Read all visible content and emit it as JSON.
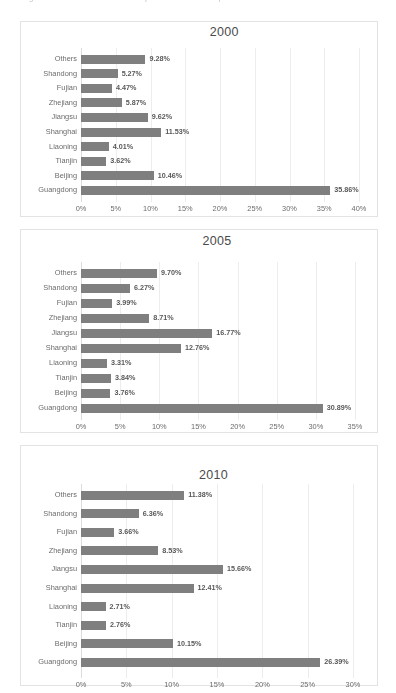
{
  "header": {
    "cut_off_text": "Figure 3. Shares of Provincial Exports in National Exports"
  },
  "panels": [
    {
      "name": "chart-2000",
      "title": "2000",
      "title_left_pct": 53,
      "chart_data": {
        "type": "bar",
        "orientation": "horizontal",
        "title": "2000",
        "xlabel": "",
        "ylabel": "",
        "xlim": [
          0,
          40
        ],
        "grid": true,
        "legend": "none",
        "categories": [
          "Others",
          "Shandong",
          "Fujian",
          "Zhejiang",
          "Jiangsu",
          "Shanghai",
          "Liaoning",
          "Tianjin",
          "Beijing",
          "Guangdong"
        ],
        "values": [
          9.28,
          5.27,
          4.47,
          5.87,
          9.62,
          11.53,
          4.01,
          3.62,
          10.46,
          35.86
        ],
        "labels": [
          "9.28%",
          "5.27%",
          "4.47%",
          "5.87%",
          "9.62%",
          "11.53%",
          "4.01%",
          "3.62%",
          "10.46%",
          "35.86%"
        ],
        "ticks": [
          "0%",
          "5%",
          "10%",
          "15%",
          "20%",
          "25%",
          "30%",
          "35%",
          "40%"
        ],
        "tick_values": [
          0,
          5,
          10,
          15,
          20,
          25,
          30,
          35,
          40
        ]
      }
    },
    {
      "name": "chart-2005",
      "title": "2005",
      "title_left_pct": 51,
      "chart_data": {
        "type": "bar",
        "orientation": "horizontal",
        "title": "2005",
        "xlabel": "",
        "ylabel": "",
        "xlim": [
          0,
          35
        ],
        "grid": true,
        "legend": "none",
        "categories": [
          "Others",
          "Shandong",
          "Fujian",
          "Zhejiang",
          "Jiangsu",
          "Shanghai",
          "Liaoning",
          "Tianjin",
          "Beijing",
          "Guangdong"
        ],
        "values": [
          9.7,
          6.27,
          3.99,
          8.71,
          16.77,
          12.76,
          3.31,
          3.84,
          3.76,
          30.89
        ],
        "labels": [
          "9.70%",
          "6.27%",
          "3.99%",
          "8.71%",
          "16.77%",
          "12.76%",
          "3.31%",
          "3.84%",
          "3.76%",
          "30.89%"
        ],
        "ticks": [
          "0%",
          "5%",
          "10%",
          "15%",
          "20%",
          "25%",
          "30%",
          "35%"
        ],
        "tick_values": [
          0,
          5,
          10,
          15,
          20,
          25,
          30,
          35
        ]
      }
    },
    {
      "name": "chart-2010",
      "title": "2010",
      "title_left_pct": 50,
      "chart_data": {
        "type": "bar",
        "orientation": "horizontal",
        "title": "2010",
        "xlabel": "",
        "ylabel": "",
        "xlim": [
          0,
          30
        ],
        "grid": true,
        "legend": "none",
        "categories": [
          "Others",
          "Shandong",
          "Fujian",
          "Zhejiang",
          "Jiangsu",
          "Shanghai",
          "Liaoning",
          "Tianjin",
          "Beijing",
          "Guangdong"
        ],
        "values": [
          11.38,
          6.36,
          3.66,
          8.53,
          15.66,
          12.41,
          2.71,
          2.76,
          10.15,
          26.39
        ],
        "labels": [
          "11.38%",
          "6.36%",
          "3.66%",
          "8.53%",
          "15.66%",
          "12.41%",
          "2.71%",
          "2.76%",
          "10.15%",
          "26.39%"
        ],
        "ticks": [
          "0%",
          "5%",
          "10%",
          "15%",
          "20%",
          "25%",
          "30%"
        ],
        "tick_values": [
          0,
          5,
          10,
          15,
          20,
          25,
          30
        ]
      }
    }
  ],
  "colors": {
    "bar": "#7f7f7f",
    "grid": "#ededf0",
    "panel_border": "#e3e3e6",
    "text": "#555555"
  }
}
